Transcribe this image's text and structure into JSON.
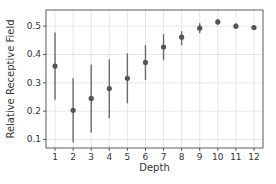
{
  "chart_data": {
    "type": "scatter",
    "title": "",
    "xlabel": "Depth",
    "ylabel": "Relative Receptive Field",
    "x": [
      1,
      2,
      3,
      4,
      5,
      6,
      7,
      8,
      9,
      10,
      11,
      12
    ],
    "series": [
      {
        "name": "Relative Receptive Field",
        "values": [
          0.359,
          0.203,
          0.245,
          0.28,
          0.316,
          0.372,
          0.426,
          0.461,
          0.493,
          0.515,
          0.5,
          0.495
        ],
        "err_low": [
          0.24,
          0.09,
          0.125,
          0.175,
          0.228,
          0.31,
          0.38,
          0.433,
          0.475,
          0.505,
          0.49,
          0.488
        ],
        "err_high": [
          0.478,
          0.316,
          0.365,
          0.383,
          0.404,
          0.433,
          0.472,
          0.482,
          0.51,
          0.525,
          0.51,
          0.502
        ]
      }
    ],
    "xticks": [
      "1",
      "2",
      "3",
      "4",
      "5",
      "6",
      "7",
      "8",
      "9",
      "10",
      "11",
      "12"
    ],
    "yticks": [
      "0.1",
      "0.2",
      "0.3",
      "0.4",
      "0.5"
    ],
    "ytick_values": [
      0.1,
      0.2,
      0.3,
      0.4,
      0.5
    ],
    "xlim": [
      0.5,
      12.5
    ],
    "ylim": [
      0.07,
      0.557
    ],
    "grid": true,
    "legend": null,
    "colors": {
      "marker": "#555555",
      "errorbar": "#6b6b6b",
      "grid": "#e0e0e0",
      "axis": "#333333"
    }
  }
}
